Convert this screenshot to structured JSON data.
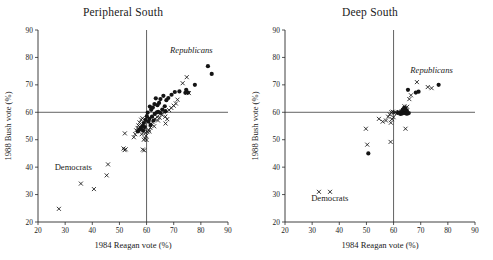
{
  "figure": {
    "panels": [
      {
        "key": "peripheral_south",
        "title": "Peripheral South",
        "annotations": [
          {
            "name": "republicans-label",
            "text": "Republicans",
            "x": 76.5,
            "y": 81.5,
            "style": "italic"
          },
          {
            "name": "democrats-label",
            "text": "Democrats",
            "x": 33.0,
            "y": 39.0,
            "style": "roman"
          }
        ]
      },
      {
        "key": "deep_south",
        "title": "Deep South",
        "annotations": [
          {
            "name": "republicans-label",
            "text": "Republicans",
            "x": 74.0,
            "y": 74.5,
            "style": "italic"
          },
          {
            "name": "democrats-label",
            "text": "Democrats",
            "x": 36.5,
            "y": 27.5,
            "style": "roman"
          }
        ]
      }
    ]
  },
  "chart_data": [
    {
      "type": "scatter",
      "title": "Peripheral South",
      "xlabel": "1984 Reagan vote (%)",
      "ylabel": "1988 Bush vote (%)",
      "xlim": [
        20,
        90
      ],
      "ylim": [
        20,
        90
      ],
      "xticks": [
        20,
        30,
        40,
        50,
        60,
        70,
        80,
        90
      ],
      "yticks": [
        20,
        30,
        40,
        50,
        60,
        70,
        80,
        90
      ],
      "grid": false,
      "legend": "none",
      "reference_lines": [
        {
          "axis": "x",
          "value": 60
        },
        {
          "axis": "y",
          "value": 60
        }
      ],
      "series": [
        {
          "name": "filled-circle",
          "marker": "circle",
          "color": "#141414",
          "points": [
            [
              82.6,
              76.8
            ],
            [
              84.0,
              74.0
            ],
            [
              77.8,
              70.0
            ],
            [
              74.6,
              68.2
            ],
            [
              75.3,
              67.2
            ],
            [
              74.3,
              67.1
            ],
            [
              72.1,
              67.6
            ],
            [
              70.4,
              67.4
            ],
            [
              69.2,
              66.4
            ],
            [
              68.0,
              65.2
            ],
            [
              67.3,
              64.4
            ],
            [
              66.2,
              66.0
            ],
            [
              65.1,
              64.8
            ],
            [
              64.6,
              63.4
            ],
            [
              64.0,
              62.6
            ],
            [
              63.4,
              65.1
            ],
            [
              62.9,
              63.0
            ],
            [
              62.3,
              61.7
            ],
            [
              61.7,
              60.9
            ],
            [
              61.2,
              62.1
            ],
            [
              66.7,
              62.2
            ],
            [
              65.8,
              61.0
            ],
            [
              64.3,
              60.2
            ],
            [
              63.0,
              59.4
            ],
            [
              62.0,
              58.4
            ],
            [
              61.0,
              57.6
            ],
            [
              60.4,
              59.9
            ],
            [
              60.1,
              58.6
            ],
            [
              59.6,
              57.2
            ],
            [
              59.0,
              56.1
            ],
            [
              58.4,
              55.0
            ],
            [
              57.9,
              54.2
            ],
            [
              57.3,
              53.6
            ],
            [
              60.7,
              56.6
            ],
            [
              63.8,
              60.0
            ],
            [
              65.0,
              59.8
            ],
            [
              67.0,
              60.4
            ],
            [
              59.3,
              54.6
            ],
            [
              58.7,
              53.3
            ],
            [
              61.5,
              55.4
            ],
            [
              56.8,
              53.0
            ],
            [
              62.6,
              57.0
            ]
          ]
        },
        {
          "name": "cross",
          "marker": "x",
          "color": "#141414",
          "points": [
            [
              27.7,
              24.8
            ],
            [
              35.8,
              34.0
            ],
            [
              40.6,
              32.0
            ],
            [
              45.3,
              37.0
            ],
            [
              45.8,
              41.0
            ],
            [
              52.0,
              52.3
            ],
            [
              51.5,
              46.8
            ],
            [
              51.9,
              46.2
            ],
            [
              52.3,
              46.5
            ],
            [
              55.3,
              50.9
            ],
            [
              55.8,
              52.0
            ],
            [
              56.2,
              53.4
            ],
            [
              56.7,
              54.3
            ],
            [
              57.0,
              55.2
            ],
            [
              57.4,
              56.3
            ],
            [
              58.0,
              57.3
            ],
            [
              58.5,
              57.8
            ],
            [
              58.9,
              55.6
            ],
            [
              59.2,
              54.0
            ],
            [
              59.5,
              52.6
            ],
            [
              59.8,
              51.4
            ],
            [
              59.4,
              50.5
            ],
            [
              59.0,
              50.0
            ],
            [
              58.6,
              46.4
            ],
            [
              59.1,
              46.1
            ],
            [
              60.3,
              52.8
            ],
            [
              60.8,
              53.5
            ],
            [
              61.4,
              54.4
            ],
            [
              62.2,
              56.4
            ],
            [
              63.1,
              57.6
            ],
            [
              63.9,
              58.3
            ],
            [
              64.8,
              58.0
            ],
            [
              65.6,
              59.1
            ],
            [
              66.4,
              60.0
            ],
            [
              66.9,
              58.4
            ],
            [
              67.6,
              57.5
            ],
            [
              68.3,
              60.8
            ],
            [
              69.1,
              61.6
            ],
            [
              70.0,
              62.4
            ],
            [
              70.8,
              63.2
            ],
            [
              71.4,
              64.6
            ],
            [
              74.8,
              72.8
            ],
            [
              73.3,
              70.6
            ],
            [
              75.6,
              67.0
            ],
            [
              67.0,
              55.9
            ],
            [
              64.2,
              57.0
            ],
            [
              62.8,
              54.9
            ],
            [
              61.0,
              53.0
            ],
            [
              60.0,
              49.9
            ],
            [
              58.2,
              52.0
            ]
          ]
        }
      ]
    },
    {
      "type": "scatter",
      "title": "Deep South",
      "xlabel": "1984 Reagan vote (%)",
      "ylabel": "1988 Bush vote (%)",
      "xlim": [
        20,
        90
      ],
      "ylim": [
        20,
        90
      ],
      "xticks": [
        20,
        30,
        40,
        50,
        60,
        70,
        80,
        90
      ],
      "yticks": [
        20,
        30,
        40,
        50,
        60,
        70,
        80,
        90
      ],
      "grid": false,
      "legend": "none",
      "reference_lines": [
        {
          "axis": "x",
          "value": 60
        },
        {
          "axis": "y",
          "value": 60
        }
      ],
      "series": [
        {
          "name": "filled-circle",
          "marker": "circle",
          "color": "#141414",
          "points": [
            [
              76.6,
              70.0
            ],
            [
              69.2,
              67.5
            ],
            [
              68.2,
              67.2
            ],
            [
              65.3,
              68.2
            ],
            [
              50.7,
              45.0
            ],
            [
              63.9,
              61.6
            ],
            [
              64.3,
              61.4
            ],
            [
              63.6,
              60.2
            ],
            [
              64.0,
              59.8
            ],
            [
              64.6,
              59.6
            ],
            [
              63.2,
              59.6
            ],
            [
              62.6,
              59.4
            ],
            [
              65.0,
              59.5
            ],
            [
              65.6,
              59.7
            ],
            [
              64.9,
              60.6
            ],
            [
              63.4,
              61.0
            ],
            [
              62.2,
              60.0
            ],
            [
              61.6,
              59.8
            ]
          ]
        },
        {
          "name": "cross",
          "marker": "x",
          "color": "#141414",
          "points": [
            [
              32.5,
              31.0
            ],
            [
              36.6,
              31.0
            ],
            [
              50.3,
              48.2
            ],
            [
              49.8,
              54.0
            ],
            [
              54.6,
              57.6
            ],
            [
              56.0,
              56.6
            ],
            [
              57.2,
              57.0
            ],
            [
              58.0,
              58.4
            ],
            [
              58.6,
              59.2
            ],
            [
              59.2,
              60.0
            ],
            [
              59.7,
              60.2
            ],
            [
              58.9,
              49.2
            ],
            [
              59.4,
              57.5
            ],
            [
              60.2,
              59.9
            ],
            [
              60.6,
              60.0
            ],
            [
              61.2,
              59.6
            ],
            [
              62.0,
              60.1
            ],
            [
              63.0,
              60.4
            ],
            [
              64.0,
              62.2
            ],
            [
              65.0,
              62.0
            ],
            [
              64.4,
              54.0
            ],
            [
              65.8,
              64.8
            ],
            [
              66.4,
              66.2
            ],
            [
              68.6,
              71.0
            ],
            [
              72.6,
              69.2
            ],
            [
              74.0,
              68.8
            ],
            [
              60.0,
              58.2
            ],
            [
              59.0,
              56.2
            ]
          ]
        }
      ]
    }
  ]
}
